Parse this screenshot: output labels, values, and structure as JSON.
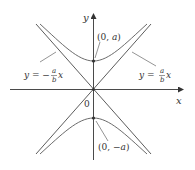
{
  "diagram": {
    "type": "hyperbola",
    "equation_form": "y^2/a^2 - x^2/b^2 = 1",
    "colors": {
      "axes": "#4a4a4a",
      "curve": "#5a5a5a",
      "asymptote": "#4a4a4a",
      "pointer": "#666666",
      "text": "#333333"
    },
    "axes": {
      "x_label": "x",
      "y_label": "y",
      "origin_label": "0"
    },
    "vertices": [
      {
        "label": "(0, a)",
        "prefix": "(0, ",
        "var": "a",
        "suffix": ")"
      },
      {
        "label": "(0, −a)",
        "prefix": "(0, −",
        "var": "a",
        "suffix": ")"
      }
    ],
    "asymptotes": [
      {
        "label": "y = −(a/b)x",
        "lhs": "y = −",
        "num": "a",
        "den": "b",
        "var": "x"
      },
      {
        "label": "y = (a/b)x",
        "lhs": "y = ",
        "num": "a",
        "den": "b",
        "var": "x"
      }
    ]
  }
}
